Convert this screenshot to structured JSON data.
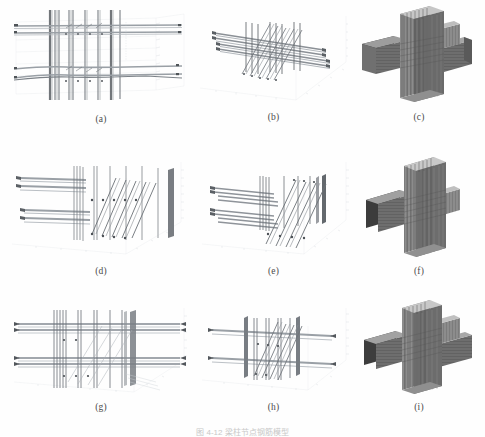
{
  "figure": {
    "caption": "图 4-12   梁柱节点钢筋模型",
    "caption_visible_note": "bottom caption partially cropped / very faint",
    "columns": 3,
    "rows": 3
  },
  "panels": [
    {
      "id": "a",
      "label": "(a)",
      "view": "front elevation wireframe",
      "content": "3D rebar cage of beam-column joint, front view",
      "axes": true
    },
    {
      "id": "b",
      "label": "(b)",
      "view": "isometric wireframe",
      "content": "3D rebar cage of beam-column joint, isometric view",
      "axes": true
    },
    {
      "id": "c",
      "label": "(c)",
      "view": "rendered solid",
      "content": "Rendered cruciform beam-column joint assembly",
      "axes": false
    },
    {
      "id": "d",
      "label": "(d)",
      "view": "front elevation wireframe",
      "content": "3D rebar cage, second specimen, front view",
      "axes": true
    },
    {
      "id": "e",
      "label": "(e)",
      "view": "isometric wireframe",
      "content": "3D rebar cage, second specimen, isometric view",
      "axes": true
    },
    {
      "id": "f",
      "label": "(f)",
      "view": "rendered solid",
      "content": "Rendered T-shaped beam-column joint assembly",
      "axes": false
    },
    {
      "id": "g",
      "label": "(g)",
      "view": "front elevation wireframe",
      "content": "3D rebar cage, third specimen, front view",
      "axes": true
    },
    {
      "id": "h",
      "label": "(h)",
      "view": "isometric wireframe",
      "content": "3D rebar cage, third specimen, isometric view",
      "axes": true
    },
    {
      "id": "i",
      "label": "(i)",
      "view": "rendered solid",
      "content": "Rendered cruciform beam-column joint assembly",
      "axes": false
    }
  ],
  "colors": {
    "page_background": "#ffffff",
    "rebar_line": "#6b7076",
    "rebar_dark": "#3f4347",
    "axis": "#c9cdd2",
    "grid": "#e2e5e8",
    "caption_text": "#4a4a4a",
    "render_concrete": "#8d8d8d",
    "render_shadow": "#3a3a3a",
    "render_highlight": "#d6d6d6"
  }
}
